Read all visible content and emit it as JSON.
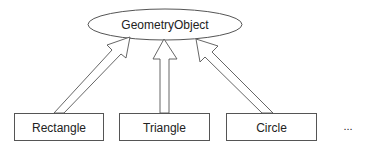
{
  "diagram": {
    "type": "class-inheritance",
    "parent": {
      "label": "GeometryObject",
      "shape": "ellipse"
    },
    "children": [
      {
        "label": "Rectangle",
        "shape": "rectangle"
      },
      {
        "label": "Triangle",
        "shape": "rectangle"
      },
      {
        "label": "Circle",
        "shape": "rectangle"
      }
    ],
    "more_indicator": "...",
    "edges": [
      {
        "from": "Rectangle",
        "to": "GeometryObject",
        "style": "hollow-double-arrow"
      },
      {
        "from": "Triangle",
        "to": "GeometryObject",
        "style": "hollow-double-arrow"
      },
      {
        "from": "Circle",
        "to": "GeometryObject",
        "style": "hollow-double-arrow"
      }
    ],
    "colors": {
      "stroke": "#555555",
      "text": "#222222",
      "background": "#ffffff"
    }
  }
}
